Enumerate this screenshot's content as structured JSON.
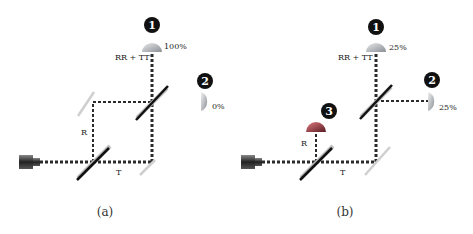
{
  "panels": [
    {
      "id": "a",
      "caption": "(a)",
      "path_labels": {
        "rr_tt": "RR + TT",
        "reflected": "R",
        "transmitted": "T"
      },
      "detectors": [
        {
          "number": "1",
          "reading": "100%",
          "color": "#9aa0a8"
        },
        {
          "number": "2",
          "reading": "0%",
          "color": "#9aa0a8"
        }
      ]
    },
    {
      "id": "b",
      "caption": "(b)",
      "path_labels": {
        "rr_tt": "RR + TT",
        "reflected": "R",
        "transmitted": "T"
      },
      "detectors": [
        {
          "number": "1",
          "reading": "25%",
          "color": "#9aa0a8"
        },
        {
          "number": "2",
          "reading": "25%",
          "color": "#9aa0a8"
        },
        {
          "number": "3",
          "reading": "",
          "color": "#b03a44"
        }
      ]
    }
  ],
  "colors": {
    "beam": "#2b2b2b",
    "beamsplitter_dark": "#111111",
    "beamsplitter_light": "#bdbdbd",
    "mirror": "#c8c8c8",
    "badge": "#111111"
  }
}
